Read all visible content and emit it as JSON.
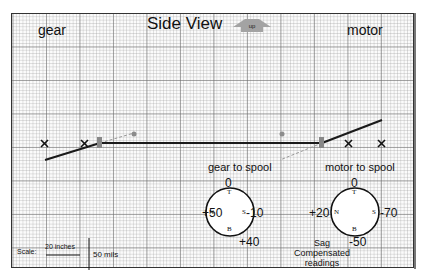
{
  "title": "Side View",
  "up_button": {
    "label": "up",
    "color": "#a3a3a3"
  },
  "labels": {
    "left": "gear",
    "right": "motor"
  },
  "markers": {
    "symbol": "×"
  },
  "dials": [
    {
      "caption": "gear to spool",
      "top": "0",
      "left": "+50",
      "right": "-10",
      "bottom": "+40",
      "letters": {
        "top": "T",
        "left": "N",
        "right": "S",
        "bottom": "B"
      }
    },
    {
      "caption": "motor to spool",
      "top": "0",
      "left": "+20",
      "right": "-70",
      "bottom": "-50",
      "letters": {
        "top": "T",
        "left": "N",
        "right": "S",
        "bottom": "B"
      }
    }
  ],
  "sag_note": {
    "line1": "Sag",
    "line2": "Compensated",
    "line3": "readings"
  },
  "scale": {
    "label": "Scale:",
    "horizontal": "20 inches",
    "vertical": "50 mils"
  },
  "colors": {
    "line": "#1a1a1a",
    "marker": "#8c8c8c",
    "grid_major": "#6e6e6e",
    "grid_minor": "#a0a0a0"
  }
}
